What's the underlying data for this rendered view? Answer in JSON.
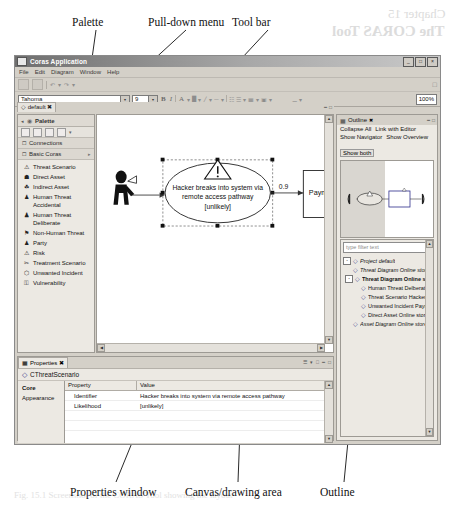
{
  "ghost_text": {
    "line1": "Chapter 15",
    "line2": "The CORAS Tool",
    "caption": "Fig. 15.1 Screenshot of the CORAS Tool showing the layout"
  },
  "callouts": [
    {
      "label": "Palette"
    },
    {
      "label": "Pull-down menu"
    },
    {
      "label": "Tool bar"
    },
    {
      "label": "Properties window"
    },
    {
      "label": "Canvas/drawing area"
    },
    {
      "label": "Outline"
    }
  ],
  "window": {
    "title": "Coras Application",
    "minimize": "_",
    "maximize": "□",
    "close": "×",
    "menus": [
      "File",
      "Edit",
      "Diagram",
      "Window",
      "Help"
    ]
  },
  "format_toolbar": {
    "font_name": "Tahoma",
    "font_size": "9",
    "bold": "B",
    "italic": "I",
    "font_color": "A",
    "zoom": "100%"
  },
  "palette": {
    "editor_tab": "default",
    "header": "Palette",
    "sections": [
      {
        "label": "Connections"
      },
      {
        "label": "Basic Coras"
      }
    ],
    "items": [
      {
        "icon": "threat-scenario-icon",
        "glyph": "⚠",
        "label": "Threat Scenario"
      },
      {
        "icon": "direct-asset-icon",
        "glyph": "☗",
        "label": "Direct Asset"
      },
      {
        "icon": "indirect-asset-icon",
        "glyph": "☘",
        "label": "Indirect Asset"
      },
      {
        "icon": "human-threat-accidental-icon",
        "glyph": "♟",
        "label": "Human Threat Accidental"
      },
      {
        "icon": "human-threat-deliberate-icon",
        "glyph": "♟",
        "label": "Human Threat Deliberate"
      },
      {
        "icon": "non-human-threat-icon",
        "glyph": "⚑",
        "label": "Non-Human Threat"
      },
      {
        "icon": "party-icon",
        "glyph": "♟",
        "label": "Party"
      },
      {
        "icon": "risk-icon",
        "glyph": "⚠",
        "label": "Risk"
      },
      {
        "icon": "treatment-scenario-icon",
        "glyph": "✂",
        "label": "Treatment Scenario"
      },
      {
        "icon": "unwanted-incident-icon",
        "glyph": "⬡",
        "label": "Unwanted Incident"
      },
      {
        "icon": "vulnerability-icon",
        "glyph": "⚿",
        "label": "Vulnerability"
      }
    ]
  },
  "canvas": {
    "actor_label": "Hacker",
    "threat_scenario_text": "Hacker breaks into system via remote access pathway",
    "threat_scenario_likelihood": "[unlikely]",
    "edge_label": "0.9",
    "asset_label": "Payment"
  },
  "properties": {
    "tab": "Properties",
    "selected_element": "CThreatScenario",
    "side_tabs": [
      "Core",
      "Appearance"
    ],
    "columns": [
      "Property",
      "Value"
    ],
    "rows": [
      {
        "property": "Identifier",
        "value": "Hacker breaks into system via remote access pathway"
      },
      {
        "property": "Likelihood",
        "value": "[unlikely]"
      }
    ]
  },
  "outline": {
    "tab": "Outline",
    "buttons": [
      "Collapse All",
      "Link with Editor",
      "Show Navigator",
      "Show Overview"
    ],
    "selected_button": "Show both",
    "filter_placeholder": "type filter text",
    "tree": [
      {
        "depth": 0,
        "label": "Project default",
        "style": "italic",
        "expander": "-"
      },
      {
        "depth": 1,
        "label": "Threat Diagram Online store",
        "style": "italic",
        "expander": ""
      },
      {
        "depth": 1,
        "label": "Threat Diagram Online sto",
        "style": "bold",
        "expander": "-"
      },
      {
        "depth": 2,
        "label": "Human Threat Delberate H",
        "style": "plain",
        "expander": ""
      },
      {
        "depth": 2,
        "label": "Threat Scenario Hacker bre",
        "style": "plain",
        "expander": ""
      },
      {
        "depth": 2,
        "label": "Unwanted Incident Paymen",
        "style": "plain",
        "expander": ""
      },
      {
        "depth": 2,
        "label": "Direct Asset Online store",
        "style": "plain",
        "expander": ""
      },
      {
        "depth": 1,
        "label": "Asset Diagram Online store",
        "style": "italic",
        "expander": ""
      }
    ]
  },
  "colors": {
    "chrome": "#d4d0c8",
    "panel": "#ece9e3",
    "border": "#9d9a94",
    "canvas": "#ffffff",
    "titlebar_start": "#6f6f6f"
  }
}
